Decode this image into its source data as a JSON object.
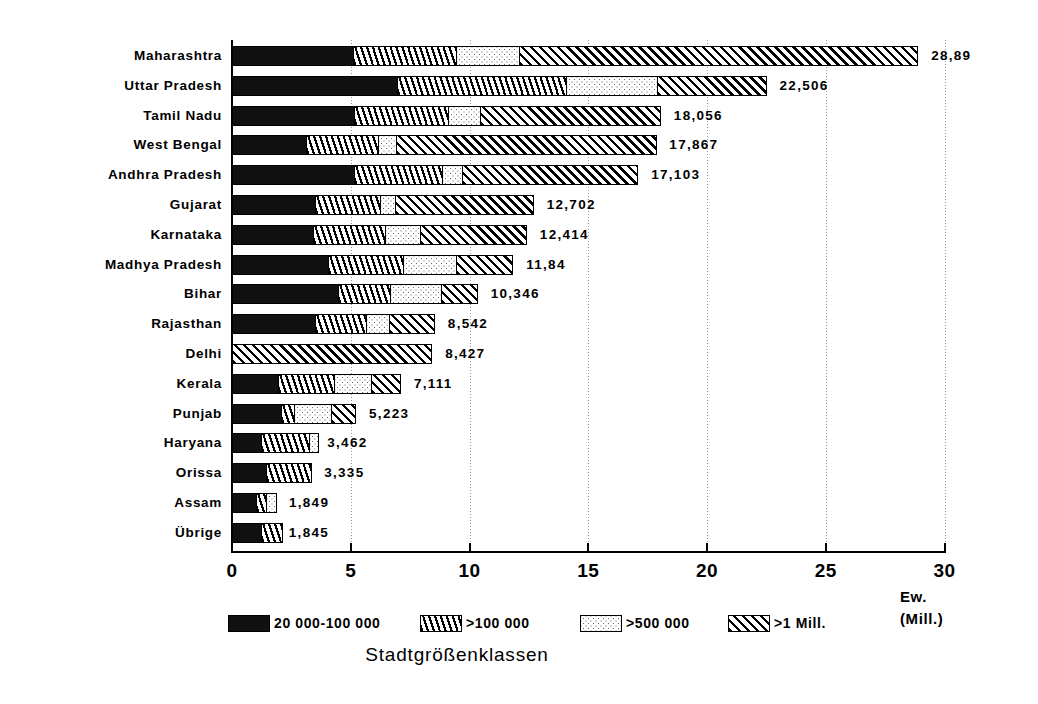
{
  "chart_data": {
    "type": "bar",
    "orientation": "horizontal",
    "stacked": true,
    "title": "",
    "xlabel": "Ew. (Mill.)",
    "ylabel": "",
    "legend_title": "Stadtgrößenklassen",
    "legend_position": "bottom",
    "grid": true,
    "xlim": [
      0,
      30
    ],
    "xticks": [
      0,
      5,
      10,
      15,
      20,
      25,
      30
    ],
    "xtick_labels": [
      "0",
      "5",
      "10",
      "15",
      "20",
      "25",
      "30"
    ],
    "unit_lines": [
      "Ew.",
      "(Mill.)"
    ],
    "series": [
      {
        "name": "20 000-100 000",
        "pattern": "solid-black",
        "values": [
          5.1,
          6.95,
          5.15,
          3.1,
          5.15,
          3.5,
          3.4,
          4.05,
          4.45,
          3.5,
          0.0,
          1.95,
          2.05,
          1.2,
          1.45,
          1.0,
          1.2
        ]
      },
      {
        "name": ">100 000",
        "pattern": "vertical-hatch",
        "values": [
          4.35,
          7.1,
          3.95,
          3.05,
          3.7,
          2.75,
          3.05,
          3.15,
          2.2,
          2.15,
          0.0,
          2.35,
          0.55,
          2.05,
          1.9,
          0.45,
          0.95
        ]
      },
      {
        "name": ">500 000",
        "pattern": "dotted",
        "values": [
          2.65,
          3.85,
          1.35,
          0.75,
          0.85,
          0.6,
          1.45,
          2.25,
          2.15,
          0.95,
          0.0,
          1.55,
          1.55,
          0.4,
          0.0,
          0.45,
          0.0
        ]
      },
      {
        "name": ">1 Mill.",
        "pattern": "diagonal-hatch",
        "values": [
          16.79,
          4.61,
          7.61,
          11.0,
          7.4,
          5.85,
          4.5,
          2.4,
          1.55,
          1.95,
          8.43,
          1.25,
          1.05,
          0.0,
          0.0,
          0.0,
          0.0
        ]
      }
    ],
    "categories": [
      "Maharashtra",
      "Uttar Pradesh",
      "Tamil Nadu",
      "West Bengal",
      "Andhra Pradesh",
      "Gujarat",
      "Karnataka",
      "Madhya Pradesh",
      "Bihar",
      "Rajasthan",
      "Delhi",
      "Kerala",
      "Punjab",
      "Haryana",
      "Orissa",
      "Assam",
      "Übrige"
    ],
    "totals": [
      28.89,
      22.506,
      18.056,
      17.867,
      17.103,
      12.702,
      12.414,
      11.84,
      10.346,
      8.542,
      8.427,
      7.111,
      5.223,
      3.462,
      3.335,
      1.849,
      1.845
    ],
    "value_labels": [
      "28,89",
      "22,506",
      "18,056",
      "17,867",
      "17,103",
      "12,702",
      "12,414",
      "11,84",
      "10,346",
      "8,542",
      "8,427",
      "7,111",
      "5,223",
      "3,462",
      "3,335",
      "1,849",
      "1,845"
    ],
    "legend": [
      {
        "label": "20 000-100 000",
        "pattern": "solid-black"
      },
      {
        "label": ">100 000",
        "pattern": "vertical-hatch"
      },
      {
        "label": ">500 000",
        "pattern": "dotted"
      },
      {
        "label": ">1 Mill.",
        "pattern": "diagonal-hatch"
      }
    ],
    "colors": {
      "ink": "#000000",
      "background": "#ffffff",
      "grid": "#9a9a9a"
    }
  }
}
